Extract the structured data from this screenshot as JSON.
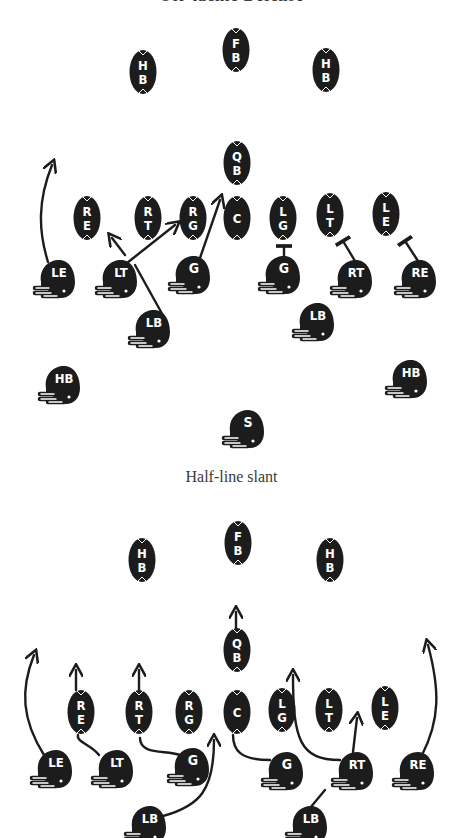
{
  "captions": {
    "top_partial": "Off-tackle Defense",
    "middle": "Half-line slant"
  },
  "colors": {
    "ink": "#1c1c1c",
    "paper": "#ffffff",
    "label": "#ffffff",
    "caption": "#3a3a3a"
  },
  "diagrams": [
    {
      "name": "diagram-1",
      "offense_ovals": [
        {
          "label": "HB",
          "x": 143,
          "y": 72
        },
        {
          "label": "FB",
          "x": 236,
          "y": 50
        },
        {
          "label": "HB",
          "x": 326,
          "y": 70
        },
        {
          "label": "QB",
          "x": 237,
          "y": 163
        },
        {
          "label": "RE",
          "x": 87,
          "y": 218
        },
        {
          "label": "RT",
          "x": 148,
          "y": 218
        },
        {
          "label": "RG",
          "x": 193,
          "y": 218
        },
        {
          "label": "C",
          "x": 237,
          "y": 218
        },
        {
          "label": "LG",
          "x": 283,
          "y": 218
        },
        {
          "label": "LT",
          "x": 330,
          "y": 215
        },
        {
          "label": "LE",
          "x": 386,
          "y": 214
        }
      ],
      "defense_helmets": [
        {
          "label": "LE",
          "x": 55,
          "y": 280
        },
        {
          "label": "LT",
          "x": 117,
          "y": 280
        },
        {
          "label": "G",
          "x": 190,
          "y": 276
        },
        {
          "label": "G",
          "x": 280,
          "y": 276
        },
        {
          "label": "RT",
          "x": 352,
          "y": 280
        },
        {
          "label": "RE",
          "x": 416,
          "y": 280
        },
        {
          "label": "LB",
          "x": 150,
          "y": 330
        },
        {
          "label": "LB",
          "x": 314,
          "y": 323
        },
        {
          "label": "HB",
          "x": 60,
          "y": 386
        },
        {
          "label": "HB",
          "x": 407,
          "y": 380
        },
        {
          "label": "S",
          "x": 244,
          "y": 430
        }
      ],
      "routes": [
        {
          "from": "LE",
          "d": "M48 262 C38 230 38 200 52 165",
          "end": "arrow"
        },
        {
          "from": "LT",
          "d": "M125 255 L112 238",
          "end": "arrow"
        },
        {
          "from": "LT",
          "d": "M127 263 L175 225",
          "end": "arrow"
        },
        {
          "from": "G",
          "d": "M200 258 L220 200",
          "end": "arrow"
        },
        {
          "from": "LB",
          "d": "M165 319 L135 265",
          "end": "none"
        },
        {
          "from": "G-right",
          "d": "M284 262 L284 246",
          "end": "block"
        },
        {
          "from": "RT",
          "d": "M355 261 L343 241",
          "end": "block"
        },
        {
          "from": "RE",
          "d": "M418 261 L405 241",
          "end": "block"
        }
      ]
    },
    {
      "name": "diagram-2",
      "offense_ovals": [
        {
          "label": "HB",
          "x": 142,
          "y": 560
        },
        {
          "label": "FB",
          "x": 238,
          "y": 543
        },
        {
          "label": "HB",
          "x": 330,
          "y": 560
        },
        {
          "label": "QB",
          "x": 237,
          "y": 650
        },
        {
          "label": "RE",
          "x": 81,
          "y": 712
        },
        {
          "label": "RT",
          "x": 139,
          "y": 712
        },
        {
          "label": "RG",
          "x": 189,
          "y": 712
        },
        {
          "label": "C",
          "x": 237,
          "y": 712
        },
        {
          "label": "LG",
          "x": 282,
          "y": 710
        },
        {
          "label": "LT",
          "x": 329,
          "y": 710
        },
        {
          "label": "LE",
          "x": 385,
          "y": 708
        }
      ],
      "defense_helmets": [
        {
          "label": "LE",
          "x": 52,
          "y": 770
        },
        {
          "label": "LT",
          "x": 113,
          "y": 770
        },
        {
          "label": "G",
          "x": 189,
          "y": 768
        },
        {
          "label": "G",
          "x": 283,
          "y": 772
        },
        {
          "label": "RT",
          "x": 353,
          "y": 772
        },
        {
          "label": "RE",
          "x": 414,
          "y": 772
        },
        {
          "label": "LB",
          "x": 146,
          "y": 826
        },
        {
          "label": "LB",
          "x": 307,
          "y": 826
        }
      ],
      "routes": [
        {
          "from": "LE",
          "d": "M44 755 C22 720 20 690 34 655",
          "end": "arrow"
        },
        {
          "from": "LT",
          "d": "M99 755 C92 745 76 742 78 735",
          "end": "none"
        },
        {
          "from": "RE-oval",
          "d": "M76 690 L76 670",
          "end": "arrow"
        },
        {
          "from": "G",
          "d": "M180 755 C165 750 140 755 140 738",
          "end": "none"
        },
        {
          "from": "RT-oval",
          "d": "M139 690 L139 670",
          "end": "arrow"
        },
        {
          "from": "LB",
          "d": "M163 816 C200 806 214 790 214 740",
          "end": "arrow"
        },
        {
          "from": "QB",
          "d": "M236 628 L236 612",
          "end": "arrow"
        },
        {
          "from": "G-right",
          "d": "M270 760 C240 760 233 750 233 735",
          "end": "none"
        },
        {
          "from": "RT",
          "d": "M340 760 C300 760 293 740 293 675",
          "end": "arrow"
        },
        {
          "from": "RT-up",
          "d": "M353 752 L357 718",
          "end": "arrow"
        },
        {
          "from": "RE",
          "d": "M422 755 C440 720 440 690 428 645",
          "end": "arrow"
        },
        {
          "from": "LB-right",
          "d": "M310 808 L325 790",
          "end": "none"
        }
      ]
    }
  ]
}
